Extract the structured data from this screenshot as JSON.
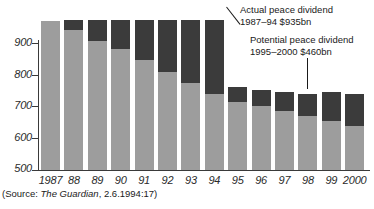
{
  "chart_data": {
    "type": "bar",
    "stacked": true,
    "title": "",
    "subtitle": "",
    "xlabel": "",
    "ylabel": "",
    "ylim": [
      500,
      1000
    ],
    "yticks": [
      500,
      600,
      700,
      800,
      900
    ],
    "ytick_labels": [
      "500",
      "600",
      "700",
      "800",
      "900"
    ],
    "grid": false,
    "legend_position": "annotations",
    "categories": [
      "1987",
      "88",
      "89",
      "90",
      "91",
      "92",
      "93",
      "94",
      "95",
      "96",
      "97",
      "98",
      "99",
      "2000"
    ],
    "series": [
      {
        "name": "Actual military spending",
        "color": "#9d9d9d",
        "values": [
          970,
          940,
          905,
          880,
          845,
          810,
          775,
          740,
          715,
          700,
          685,
          670,
          655,
          640
        ]
      },
      {
        "name": "Peace dividend",
        "color": "#3b3b3b",
        "values": [
          0,
          32,
          68,
          92,
          128,
          163,
          197,
          232,
          45,
          52,
          60,
          70,
          90,
          100
        ]
      }
    ],
    "bar_totals": [
      970,
      972,
      973,
      972,
      973,
      973,
      972,
      972,
      760,
      752,
      745,
      740,
      745,
      740
    ],
    "annotations": [
      {
        "name": "actual-peace-dividend",
        "line1": "Actual peace dividend",
        "line2": "1987–94 $935bn"
      },
      {
        "name": "potential-peace-dividend",
        "line1": "Potential peace dividend",
        "line2": "1995–2000 $460bn"
      }
    ],
    "source": {
      "prefix": "(Source: ",
      "publication": "The Guardian",
      "suffix": ", 2.6.1994:17)"
    }
  },
  "colors": {
    "gray_segment": "#9d9d9d",
    "dark_segment": "#3b3b3b",
    "axis": "#3a3a3a",
    "text": "#1a1a1a",
    "background": "#ffffff"
  }
}
